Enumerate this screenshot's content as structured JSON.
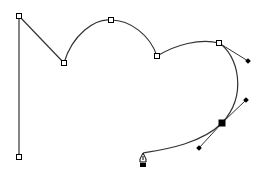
{
  "figure": {
    "colors": {
      "background": "#ffffff",
      "stroke": "#333333",
      "anchor_fill": "#ffffff",
      "selected_fill": "#000000"
    },
    "anchors": [
      {
        "x": 19,
        "y": 16,
        "type": "corner"
      },
      {
        "x": 19,
        "y": 157,
        "type": "corner"
      },
      {
        "x": 64,
        "y": 63,
        "type": "corner"
      },
      {
        "x": 111,
        "y": 20,
        "type": "smooth"
      },
      {
        "x": 157,
        "y": 56,
        "type": "corner"
      },
      {
        "x": 219,
        "y": 43,
        "type": "smooth"
      },
      {
        "x": 222,
        "y": 123,
        "type": "selected"
      }
    ],
    "handles": [
      {
        "from": [
          219,
          43
        ],
        "to": [
          248,
          61
        ]
      },
      {
        "from": [
          222,
          123
        ],
        "to": [
          246,
          100
        ]
      },
      {
        "from": [
          222,
          123
        ],
        "to": [
          199,
          148
        ]
      }
    ],
    "cursor": {
      "icon": "pen-tool-icon",
      "x": 143,
      "y": 153
    }
  }
}
